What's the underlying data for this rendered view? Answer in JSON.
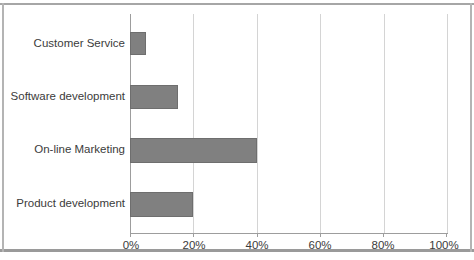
{
  "chart_data": {
    "type": "bar",
    "orientation": "horizontal",
    "title": "",
    "xlabel": "",
    "ylabel": "",
    "categories": [
      "Customer Service",
      "Software development",
      "On-line Marketing",
      "Product development"
    ],
    "values": [
      5,
      15,
      40,
      20
    ],
    "value_suffix": "%",
    "xlim": [
      0,
      100
    ],
    "xticks": [
      0,
      20,
      40,
      60,
      80,
      100
    ],
    "xtick_labels": [
      "0%",
      "20%",
      "40%",
      "60%",
      "80%",
      "100%"
    ],
    "grid": {
      "vertical": true,
      "horizontal": false
    },
    "legend": {
      "visible": false,
      "position": "none"
    },
    "series": [
      {
        "name": "Series 1",
        "color": "#808080",
        "values": [
          5,
          15,
          40,
          20
        ]
      }
    ],
    "colors": {
      "bar_fill": "#808080",
      "bar_stroke": "#6e6e6e",
      "gridline": "#d4d4d4",
      "axis": "#9d9d9d",
      "text": "#3b3b3b",
      "background": "#ffffff",
      "frame": "#a6a6a6"
    }
  }
}
